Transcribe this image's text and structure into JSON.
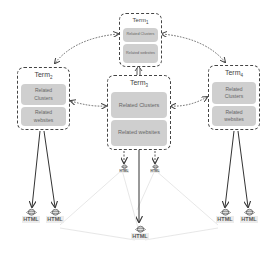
{
  "diagram": {
    "terms": [
      {
        "id": "term1",
        "label": "Term",
        "sub": "1",
        "clusters": "Related Clusters",
        "websites": "Related websites"
      },
      {
        "id": "term2",
        "label": "Term",
        "sub": "2",
        "clusters": "Related Clusters",
        "websites": "Related websites"
      },
      {
        "id": "term3",
        "label": "Term",
        "sub": "3",
        "clusters": "Related Clusters",
        "websites": "Related websites"
      },
      {
        "id": "term4",
        "label": "Term",
        "sub": "4",
        "clusters": "Related Clusters",
        "websites": "Related websites"
      }
    ],
    "html_label": "HTML",
    "edges": {
      "bidirectional_dotted": [
        [
          "term1",
          "term2"
        ],
        [
          "term1",
          "term4"
        ],
        [
          "term2",
          "term3"
        ],
        [
          "term3",
          "term4"
        ],
        [
          "term1",
          "term3"
        ]
      ],
      "solid_to_pages": [
        [
          "term2",
          "html-1"
        ],
        [
          "term2",
          "html-2"
        ],
        [
          "term3",
          "html-small-1"
        ],
        [
          "term3",
          "html-small-2"
        ],
        [
          "term3",
          "html-3"
        ],
        [
          "term4",
          "html-4"
        ],
        [
          "term4",
          "html-5"
        ]
      ]
    },
    "colors": {
      "box_border": "#444444",
      "cell_fill": "#cfcfcf",
      "cell_text": "#666666",
      "page_links": "#e6e6e6"
    }
  }
}
